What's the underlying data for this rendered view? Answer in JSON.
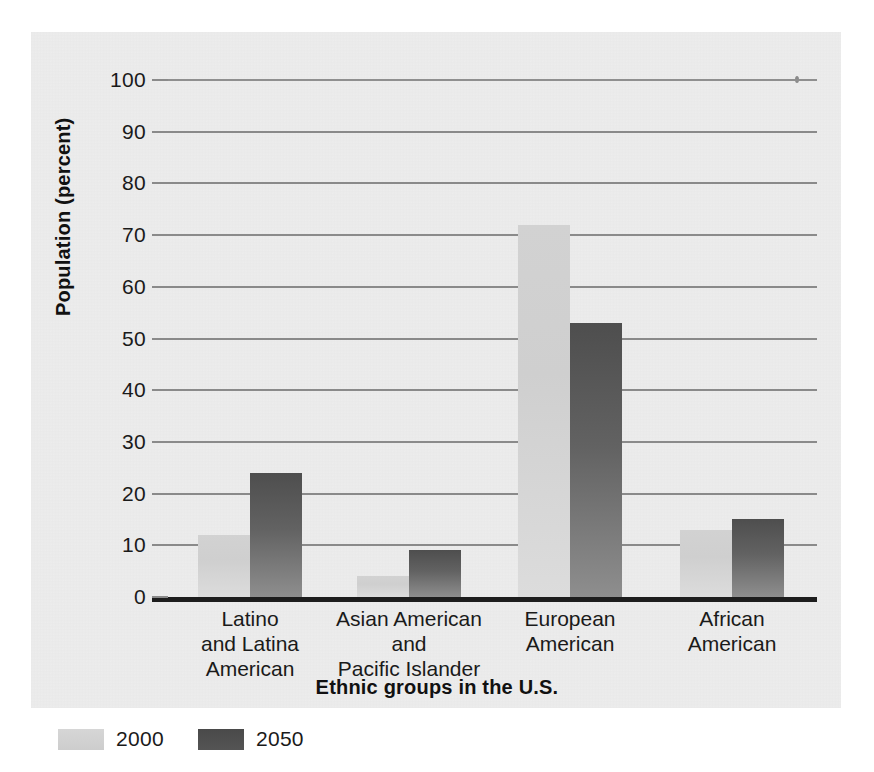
{
  "chart_data": {
    "type": "bar",
    "title": "",
    "xlabel": "Ethnic groups in the U.S.",
    "ylabel": "Population (percent)",
    "categories": [
      "Latino\nand Latina\nAmerican",
      "Asian American\nand\nPacific Islander",
      "European\nAmerican",
      "African\nAmerican"
    ],
    "series": [
      {
        "name": "2000",
        "values": [
          12,
          4,
          72,
          13
        ],
        "color": "#d2d2d2"
      },
      {
        "name": "2050",
        "values": [
          24,
          9,
          53,
          15
        ],
        "color": "#555555"
      }
    ],
    "ylim": [
      0,
      100
    ],
    "yticks": [
      0,
      10,
      20,
      30,
      40,
      50,
      60,
      70,
      80,
      90,
      100
    ],
    "ytick_labels": [
      "0",
      "10",
      "20",
      "30",
      "40",
      "50",
      "60",
      "70",
      "80",
      "90",
      "100"
    ],
    "grid": true,
    "legend_position": "bottom-left"
  },
  "legend": {
    "items": [
      {
        "label": "2000",
        "swatch": "light-gray-swatch"
      },
      {
        "label": "2050",
        "swatch": "dark-gray-swatch"
      }
    ]
  },
  "colors": {
    "panel_background": "#ededed",
    "gridline": "#8a8a8a",
    "axis": "#1d1d1d",
    "bar_2000": "#d2d2d2",
    "bar_2050": "#555555",
    "text": "#1a1a1a"
  }
}
